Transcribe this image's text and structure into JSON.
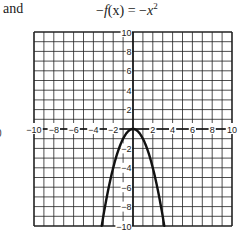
{
  "header": {
    "left_text": "and",
    "equation_lhs_prefix": "−",
    "equation_lhs_func": "f",
    "equation_lhs_arg": "(x)",
    "equation_eq": " = −",
    "equation_var": "x",
    "equation_exp": "2"
  },
  "edge_fragment": "0",
  "chart_data": {
    "type": "line",
    "function": "y = -x^2",
    "xlabel": "",
    "ylabel": "",
    "xlim": [
      -10,
      10
    ],
    "ylim": [
      -10,
      10
    ],
    "grid": true,
    "grid_step": 1,
    "x_tick_labels": [
      "-10",
      "-8",
      "-6",
      "-4",
      "-2",
      "2",
      "4",
      "6",
      "8",
      "10"
    ],
    "y_tick_labels": [
      "10",
      "8",
      "6",
      "4",
      "2",
      "-2",
      "-4",
      "-6",
      "-8",
      "-10"
    ],
    "series": [
      {
        "name": "-x^2",
        "x": [
          -3.16,
          -3,
          -2.5,
          -2,
          -1.5,
          -1,
          -0.5,
          0,
          0.5,
          1,
          1.5,
          2,
          2.5,
          3,
          3.16
        ],
        "y": [
          -10,
          -9,
          -6.25,
          -4,
          -2.25,
          -1,
          -0.25,
          0,
          -0.25,
          -1,
          -2.25,
          -4,
          -6.25,
          -9,
          -10
        ]
      }
    ],
    "colors": {
      "curve": "#111111",
      "grid": "#222222",
      "axis": "#111111"
    }
  }
}
